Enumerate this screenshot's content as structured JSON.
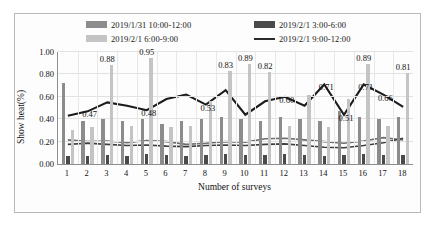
{
  "chart_data": {
    "type": "bar",
    "title": "",
    "xlabel": "Number of surveys",
    "ylabel": "Show heat(%)",
    "ylim": [
      0.0,
      1.0
    ],
    "ytick_labels": [
      "0.00",
      "0.20",
      "0.40",
      "0.60",
      "0.80",
      "1.00"
    ],
    "ytick_values": [
      0.0,
      0.2,
      0.4,
      0.6,
      0.8,
      1.0
    ],
    "grid": true,
    "legend_position": "top",
    "categories": [
      "1",
      "2",
      "3",
      "4",
      "5",
      "6",
      "7",
      "8",
      "9",
      "10",
      "11",
      "12",
      "13",
      "14",
      "15",
      "16",
      "17",
      "18"
    ],
    "series": [
      {
        "name": "2019/1/31 10:00-12:00",
        "kind": "bar",
        "color": "#8c8c8c",
        "values": [
          0.72,
          0.38,
          0.4,
          0.38,
          0.4,
          0.36,
          0.38,
          0.4,
          0.42,
          0.4,
          0.38,
          0.42,
          0.4,
          0.38,
          0.47,
          0.42,
          0.4,
          0.42
        ]
      },
      {
        "name": "2019/2/1 3:00-6:00",
        "kind": "bar",
        "color": "#4a4a4a",
        "values": [
          0.07,
          0.07,
          0.08,
          0.07,
          0.09,
          0.08,
          0.07,
          0.08,
          0.09,
          0.08,
          0.08,
          0.09,
          0.08,
          0.07,
          0.08,
          0.09,
          0.08,
          0.08
        ]
      },
      {
        "name": "2019/2/1 6:00-9:00",
        "kind": "bar",
        "color": "#c4c4c4",
        "values": [
          0.3,
          0.33,
          0.88,
          0.34,
          0.95,
          0.33,
          0.34,
          0.56,
          0.83,
          0.89,
          0.82,
          0.34,
          0.62,
          0.33,
          0.58,
          0.89,
          0.34,
          0.81
        ]
      },
      {
        "name": "2019/2/1 9:00-12:00",
        "kind": "line",
        "color": "#1c1c1c",
        "values": [
          0.43,
          0.47,
          0.55,
          0.52,
          0.48,
          0.58,
          0.62,
          0.53,
          0.66,
          0.44,
          0.56,
          0.6,
          0.52,
          0.71,
          0.44,
          0.71,
          0.62,
          0.51
        ],
        "point_labels": [
          "",
          "0.47",
          "",
          "",
          "0.48",
          "",
          "",
          "0.53",
          "",
          "",
          "",
          "0.60",
          "",
          "0.71",
          "0.51",
          "0.71",
          "0.66",
          ""
        ]
      }
    ],
    "bar_top_labels": [
      {
        "index": 2,
        "value": "0.88"
      },
      {
        "index": 4,
        "value": "0.95"
      },
      {
        "index": 8,
        "value": "0.83"
      },
      {
        "index": 9,
        "value": "0.89"
      },
      {
        "index": 10,
        "value": "0.82"
      },
      {
        "index": 15,
        "value": "0.89"
      },
      {
        "index": 17,
        "value": "0.81"
      }
    ],
    "line_labels": [
      {
        "index": 1,
        "value": "0.47"
      },
      {
        "index": 4,
        "value": "0.48"
      },
      {
        "index": 7,
        "value": "0.53"
      },
      {
        "index": 11,
        "value": "0.60"
      },
      {
        "index": 13,
        "value": "0.71"
      },
      {
        "index": 15,
        "value": "0.71"
      },
      {
        "index": 14,
        "value": "0.51"
      },
      {
        "index": 16,
        "value": "0.66"
      }
    ],
    "secondary_lines": [
      {
        "name": "secondary-line-upper",
        "color": "#6f6f6f",
        "values": [
          0.215,
          0.2,
          0.205,
          0.19,
          0.21,
          0.2,
          0.175,
          0.185,
          0.2,
          0.195,
          0.225,
          0.23,
          0.215,
          0.2,
          0.185,
          0.205,
          0.235,
          0.215
        ]
      },
      {
        "name": "secondary-line-lower",
        "color": "#3d3d3d",
        "values": [
          0.175,
          0.185,
          0.175,
          0.165,
          0.17,
          0.16,
          0.155,
          0.165,
          0.17,
          0.165,
          0.175,
          0.18,
          0.165,
          0.15,
          0.145,
          0.165,
          0.19,
          0.23
        ]
      }
    ]
  },
  "legend": {
    "items": [
      {
        "label": "2019/1/31 10:00-12:00",
        "marker": "bar",
        "color": "#8c8c8c"
      },
      {
        "label": "2019/2/1 3:00-6:00",
        "marker": "bar",
        "color": "#4a4a4a"
      },
      {
        "label": "2019/2/1 6:00-9:00",
        "marker": "bar",
        "color": "#c4c4c4"
      },
      {
        "label": "2019/2/1 9:00-12:00",
        "marker": "line",
        "color": "#2b2b2b"
      }
    ]
  },
  "axes": {
    "y_title": "Show heat(%)",
    "x_title": "Number of surveys"
  }
}
